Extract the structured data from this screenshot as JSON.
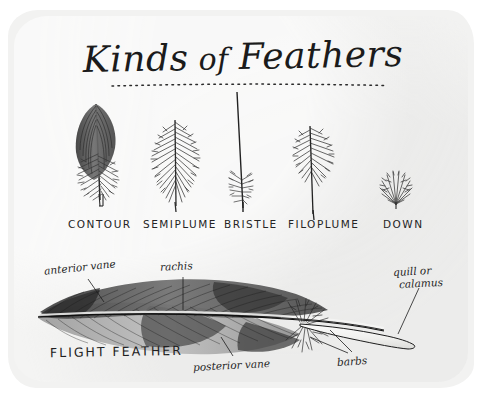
{
  "page": {
    "title": "Kinds of Feathers",
    "title_word_1": "Kinds",
    "title_word_2": "of",
    "title_word_3": "Feathers",
    "paper_color": "#f3f3f2",
    "ink_color": "#1f1f1f",
    "background_color": "#ffffff"
  },
  "feather_types": [
    {
      "label": "CONTOUR",
      "icon": "contour-feather-icon"
    },
    {
      "label": "SEMIPLUME",
      "icon": "semiplume-feather-icon"
    },
    {
      "label": "BRISTLE",
      "icon": "bristle-feather-icon"
    },
    {
      "label": "FILOPLUME",
      "icon": "filoplume-feather-icon"
    },
    {
      "label": "DOWN",
      "icon": "down-feather-icon"
    }
  ],
  "flight_feather": {
    "title": "FLIGHT FEATHER",
    "parts": [
      {
        "label": "anterior vane",
        "style": "script"
      },
      {
        "label": "rachis",
        "style": "script"
      },
      {
        "label": "quill or",
        "style": "script"
      },
      {
        "label": "calamus",
        "style": "script"
      },
      {
        "label": "posterior vane",
        "style": "script"
      },
      {
        "label": "barbs",
        "style": "script"
      }
    ]
  }
}
